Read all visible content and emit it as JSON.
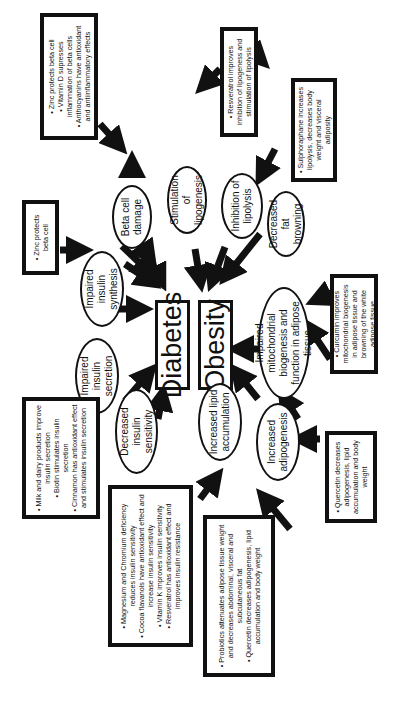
{
  "diagram": {
    "center": {
      "diabetes": "Diabetes",
      "obesity": "Obesity"
    },
    "diabetes_causes": [
      {
        "id": "beta-cell-damage",
        "label": "Beta cell damage"
      },
      {
        "id": "impaired-insulin-synthesis",
        "label": "Impaired insulin synthesis"
      },
      {
        "id": "impaired-insulin-secretion",
        "label": "Impaired insulin secretion"
      },
      {
        "id": "decreased-insulin-sensitivity",
        "label": "Decreased insulin sensitivity"
      }
    ],
    "obesity_causes": [
      {
        "id": "stimulation-of-lipogenesis",
        "label": "Stimulation of lipogenesis"
      },
      {
        "id": "inhibition-of-lipolysis",
        "label": "Inhibition of lipolysis"
      },
      {
        "id": "decreased-fat-browning",
        "label": "Decreased fat browning"
      },
      {
        "id": "impaired-mitochondrial",
        "label": "Impaired mitochondrial biogenesis and function in adipose tissue"
      },
      {
        "id": "increased-adipogenesis",
        "label": "Increased adipogenesis"
      },
      {
        "id": "increased-lipid-accumulation",
        "label": "Increased lipid accumulation"
      }
    ],
    "interventions": {
      "beta_cell": [
        "Zinc protects beta cell",
        "Vitamin D supresses inflammation of beta cells",
        "Anthocyanins have antioxidant and antiinflammatory effects"
      ],
      "insulin_synthesis": [
        "Zinc protects beta cell"
      ],
      "insulin_secretion": [
        "Milk and dairy products improve insulin secretion",
        "Biotin stimulates insulin secretion",
        "Cinnamon has antioxidant effect and stimulates insulin secretion"
      ],
      "insulin_sensitivity": [
        "Magnesium and Chromium deficiency reduces insulin sensitivity",
        "Cocoa flavanols have antioxidant effect and increase insulin sensitivity",
        "Vitamin K improves insulin sensitivity",
        "Resveratrol has antioxidant effect and improves insulin resistance"
      ],
      "lipid_accumulation": [
        "Probiotics attenuates adipose tissue weight and decreases abdominal, visceral and subcutaneous fat",
        "Quercetin decreases adipogenesis, lipid accumulation and body weight"
      ],
      "adipogenesis": [
        "Quercetin decreases adipogenesis, lipid accumulation and body weight"
      ],
      "mitochondrial": [
        "Curcumin improves mitochondrial biogenesis in adipose tissue and browning of the white adipose tissue"
      ],
      "lipolysis": [
        "Sulphoraphane increases lipolysis, decreases body weight and visceral adiposity"
      ],
      "lipogenesis": [
        "Resveratrol improves inhibition of lipogeness and stimulation of lipolysis"
      ]
    }
  }
}
